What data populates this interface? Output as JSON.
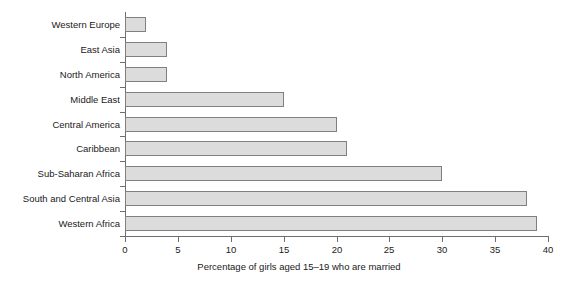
{
  "chart_data": {
    "type": "bar",
    "orientation": "horizontal",
    "title": "",
    "xlabel": "Percentage of girls aged 15–19 who are married",
    "ylabel": "",
    "xlim": [
      0,
      40
    ],
    "xticks": [
      0,
      5,
      10,
      15,
      20,
      25,
      30,
      35,
      40
    ],
    "grid": false,
    "legend": null,
    "bar_fill_color": "#dcdcdc",
    "bar_border_color": "#808080",
    "axis_color": "#6e6e6e",
    "background_color": "#ffffff",
    "categories": [
      "Western Europe",
      "East Asia",
      "North America",
      "Middle East",
      "Central America",
      "Caribbean",
      "Sub-Saharan Africa",
      "South and Central Asia",
      "Western Africa"
    ],
    "values": [
      2,
      4,
      4,
      15,
      20,
      21,
      30,
      38,
      39
    ]
  }
}
